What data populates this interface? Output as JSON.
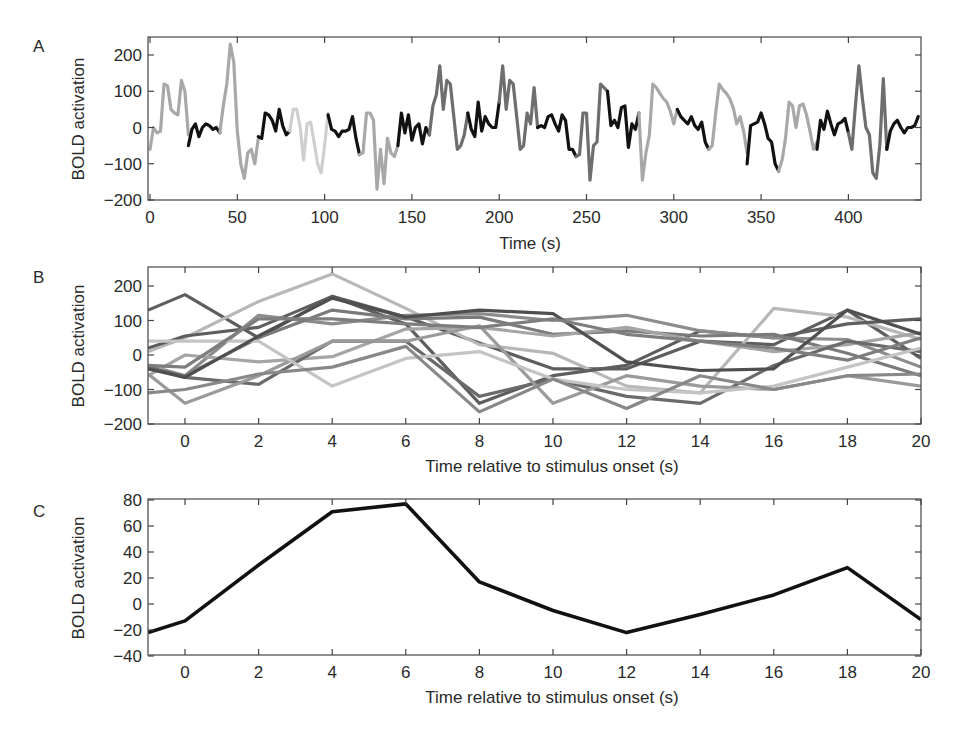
{
  "chart_data": [
    {
      "panel": "A",
      "type": "line",
      "title": "",
      "xlabel": "Time (s)",
      "ylabel": "BOLD activation",
      "xlim": [
        0,
        440
      ],
      "ylim": [
        -200,
        250
      ],
      "xticks": [
        0,
        50,
        100,
        150,
        200,
        250,
        300,
        350,
        400
      ],
      "yticks": [
        -200,
        -100,
        0,
        100,
        200
      ],
      "grid": false,
      "note": "Continuous BOLD time series drawn as segments shaded by trial (black / light gray / mid gray / dark gray)",
      "segments": [
        {
          "color": "#a8a8a8",
          "x": [
            0,
            2,
            4,
            6,
            8,
            10,
            12,
            14,
            16,
            18,
            20,
            22
          ],
          "y": [
            -60,
            0,
            -15,
            -10,
            120,
            115,
            50,
            40,
            35,
            130,
            100,
            -20
          ]
        },
        {
          "color": "#111111",
          "x": [
            22,
            24,
            26,
            28,
            30,
            32,
            34,
            36,
            38,
            40
          ],
          "y": [
            -50,
            -5,
            10,
            -25,
            0,
            10,
            5,
            -5,
            0,
            -15
          ]
        },
        {
          "color": "#a8a8a8",
          "x": [
            40,
            42,
            44,
            46,
            48,
            50,
            52,
            54,
            56,
            58,
            60,
            62
          ],
          "y": [
            -15,
            60,
            120,
            230,
            180,
            -10,
            -100,
            -140,
            -70,
            -60,
            -100,
            -30
          ]
        },
        {
          "color": "#111111",
          "x": [
            62,
            64,
            66,
            68,
            70,
            72,
            74,
            76,
            78,
            80
          ],
          "y": [
            -25,
            -30,
            40,
            35,
            20,
            -10,
            50,
            5,
            -20,
            -10
          ]
        },
        {
          "color": "#cfcfcf",
          "x": [
            80,
            82,
            84,
            86,
            88,
            90,
            92,
            94,
            96,
            98,
            100,
            102
          ],
          "y": [
            -10,
            50,
            50,
            0,
            -90,
            10,
            15,
            -40,
            -100,
            -125,
            -50,
            40
          ]
        },
        {
          "color": "#111111",
          "x": [
            102,
            104,
            106,
            108,
            110,
            112,
            114,
            116,
            118,
            120
          ],
          "y": [
            35,
            -5,
            -10,
            -25,
            -10,
            -10,
            -5,
            30,
            -30,
            -75
          ]
        },
        {
          "color": "#a8a8a8",
          "x": [
            120,
            122,
            124,
            126,
            128,
            130,
            132,
            134,
            136,
            138,
            140,
            142
          ],
          "y": [
            -75,
            -70,
            40,
            40,
            20,
            -170,
            -60,
            -155,
            -30,
            -70,
            -80,
            -50
          ]
        },
        {
          "color": "#111111",
          "x": [
            142,
            144,
            146,
            148,
            150,
            152,
            154,
            156,
            158,
            160
          ],
          "y": [
            -50,
            40,
            -15,
            35,
            -35,
            0,
            10,
            -45,
            0,
            -20
          ]
        },
        {
          "color": "#6e6e6e",
          "x": [
            160,
            162,
            164,
            166,
            168,
            170,
            172,
            174,
            176,
            178,
            180,
            182
          ],
          "y": [
            -20,
            60,
            90,
            170,
            50,
            130,
            120,
            30,
            -60,
            -50,
            -20,
            40
          ]
        },
        {
          "color": "#111111",
          "x": [
            182,
            184,
            186,
            188,
            190,
            192,
            194,
            196,
            198,
            200
          ],
          "y": [
            40,
            -5,
            -25,
            70,
            -10,
            30,
            10,
            0,
            0,
            70
          ]
        },
        {
          "color": "#6e6e6e",
          "x": [
            200,
            202,
            204,
            206,
            208,
            210,
            212,
            214,
            216,
            218,
            220,
            222
          ],
          "y": [
            70,
            170,
            50,
            130,
            120,
            30,
            -60,
            -50,
            40,
            10,
            110,
            0
          ]
        },
        {
          "color": "#111111",
          "x": [
            222,
            224,
            226,
            228,
            230,
            232,
            234,
            236,
            238,
            240,
            242,
            244
          ],
          "y": [
            0,
            5,
            0,
            30,
            35,
            10,
            -10,
            35,
            20,
            -60,
            -60,
            -80
          ]
        },
        {
          "color": "#6e6e6e",
          "x": [
            244,
            246,
            248,
            250,
            252,
            254,
            256,
            258,
            260,
            262
          ],
          "y": [
            -80,
            -75,
            40,
            40,
            -145,
            -50,
            -40,
            120,
            110,
            100
          ]
        },
        {
          "color": "#111111",
          "x": [
            262,
            264,
            266,
            268,
            270,
            272,
            274,
            276,
            278,
            280
          ],
          "y": [
            100,
            5,
            20,
            0,
            55,
            60,
            -55,
            10,
            -5,
            40
          ]
        },
        {
          "color": "#a8a8a8",
          "x": [
            280,
            282,
            284,
            286,
            288,
            290,
            292,
            294,
            296,
            298,
            300,
            302
          ],
          "y": [
            40,
            -145,
            -70,
            -20,
            120,
            110,
            95,
            80,
            70,
            45,
            10,
            50
          ]
        },
        {
          "color": "#111111",
          "x": [
            302,
            304,
            306,
            308,
            310,
            312,
            314,
            316,
            318,
            320
          ],
          "y": [
            50,
            30,
            20,
            10,
            30,
            5,
            -5,
            15,
            -40,
            -60
          ]
        },
        {
          "color": "#a8a8a8",
          "x": [
            320,
            322,
            324,
            326,
            328,
            330,
            332,
            334,
            336,
            338,
            340,
            342
          ],
          "y": [
            -60,
            -50,
            40,
            120,
            105,
            95,
            80,
            55,
            10,
            30,
            -10,
            -70
          ]
        },
        {
          "color": "#111111",
          "x": [
            342,
            344,
            346,
            348,
            350,
            352,
            354,
            356,
            358,
            360
          ],
          "y": [
            -100,
            5,
            10,
            15,
            40,
            10,
            -30,
            -40,
            -100,
            -120
          ]
        },
        {
          "color": "#a8a8a8",
          "x": [
            360,
            362,
            364,
            366,
            368,
            370,
            372,
            374,
            376,
            378,
            380,
            382
          ],
          "y": [
            -120,
            -90,
            -30,
            70,
            60,
            0,
            60,
            65,
            35,
            -10,
            -60,
            -40
          ]
        },
        {
          "color": "#111111",
          "x": [
            382,
            384,
            386,
            388,
            390,
            392,
            394,
            396,
            398,
            400
          ],
          "y": [
            -60,
            20,
            -5,
            45,
            10,
            -20,
            10,
            15,
            25,
            -15
          ]
        },
        {
          "color": "#6e6e6e",
          "x": [
            400,
            402,
            404,
            406,
            408,
            410,
            412,
            414,
            416,
            418,
            420,
            422
          ],
          "y": [
            -15,
            -60,
            60,
            170,
            80,
            0,
            -20,
            -125,
            -140,
            -50,
            135,
            -60
          ]
        },
        {
          "color": "#111111",
          "x": [
            422,
            424,
            426,
            428,
            430,
            432,
            434,
            436,
            438,
            440
          ],
          "y": [
            -60,
            -10,
            10,
            20,
            0,
            -15,
            0,
            0,
            5,
            30
          ]
        }
      ]
    },
    {
      "panel": "B",
      "type": "line",
      "title": "",
      "xlabel": "Time relative to stimulus onset (s)",
      "ylabel": "BOLD activation",
      "xlim": [
        -1,
        20
      ],
      "ylim": [
        -200,
        250
      ],
      "xticks": [
        0,
        2,
        4,
        6,
        8,
        10,
        12,
        14,
        16,
        18,
        20
      ],
      "yticks": [
        -200,
        -100,
        0,
        100,
        200
      ],
      "grid": false,
      "x": [
        -1,
        0,
        2,
        4,
        6,
        8,
        10,
        12,
        14,
        16,
        18,
        20
      ],
      "series": [
        {
          "name": "trial 1",
          "color": "#5e5e5e",
          "values": [
            130,
            175,
            50,
            170,
            110,
            35,
            -40,
            -40,
            40,
            30,
            130,
            -10
          ]
        },
        {
          "name": "trial 2",
          "color": "#b8b8b8",
          "values": [
            10,
            50,
            155,
            235,
            135,
            30,
            5,
            -90,
            -110,
            135,
            110,
            45
          ]
        },
        {
          "name": "trial 3",
          "color": "#5e5e5e",
          "values": [
            20,
            55,
            80,
            170,
            90,
            -140,
            -60,
            -30,
            70,
            50,
            90,
            105
          ]
        },
        {
          "name": "trial 4",
          "color": "#8c8c8c",
          "values": [
            -30,
            -60,
            115,
            90,
            115,
            120,
            100,
            115,
            70,
            50,
            45,
            -35
          ]
        },
        {
          "name": "trial 5",
          "color": "#7a7a7a",
          "values": [
            -40,
            -60,
            50,
            130,
            105,
            110,
            60,
            70,
            55,
            60,
            5,
            -60
          ]
        },
        {
          "name": "trial 6",
          "color": "#a5a5a5",
          "values": [
            -60,
            0,
            -20,
            -5,
            75,
            80,
            55,
            80,
            40,
            10,
            30,
            65
          ]
        },
        {
          "name": "trial 7",
          "color": "#6a6a6a",
          "values": [
            -35,
            -65,
            -85,
            40,
            40,
            -120,
            -70,
            -120,
            -140,
            -30,
            40,
            10
          ]
        },
        {
          "name": "trial 8",
          "color": "#9a9a9a",
          "values": [
            -55,
            -140,
            -60,
            40,
            40,
            85,
            -140,
            -60,
            -90,
            -100,
            -60,
            -90
          ]
        },
        {
          "name": "trial 9",
          "color": "#c4c4c4",
          "values": [
            40,
            40,
            40,
            -90,
            -10,
            10,
            -70,
            -100,
            -110,
            -90,
            -35,
            20
          ]
        },
        {
          "name": "trial 10",
          "color": "#888888",
          "values": [
            -110,
            -100,
            -55,
            -35,
            25,
            -165,
            -70,
            -155,
            -60,
            -100,
            -60,
            -55
          ]
        },
        {
          "name": "trial 11",
          "color": "#4f4f4f",
          "values": [
            -40,
            -65,
            55,
            165,
            110,
            130,
            120,
            -20,
            -45,
            -40,
            130,
            60
          ]
        },
        {
          "name": "trial 12",
          "color": "#7e7e7e",
          "values": [
            -30,
            -35,
            105,
            105,
            90,
            80,
            105,
            60,
            40,
            20,
            -15,
            50
          ]
        }
      ]
    },
    {
      "panel": "C",
      "type": "line",
      "title": "",
      "xlabel": "Time relative to stimulus onset (s)",
      "ylabel": "BOLD activation",
      "xlim": [
        -1,
        20
      ],
      "ylim": [
        -40,
        80
      ],
      "xticks": [
        0,
        2,
        4,
        6,
        8,
        10,
        12,
        14,
        16,
        18,
        20
      ],
      "yticks": [
        -40,
        -20,
        0,
        20,
        40,
        60,
        80
      ],
      "grid": false,
      "x": [
        -1,
        0,
        2,
        4,
        6,
        8,
        10,
        12,
        14,
        16,
        18,
        20
      ],
      "series": [
        {
          "name": "average",
          "color": "#111111",
          "values": [
            -22,
            -13,
            30,
            71,
            77,
            17,
            -5,
            -22,
            -8,
            7,
            28,
            -12
          ]
        }
      ]
    }
  ],
  "labels": {
    "panel_a": "A",
    "panel_b": "B",
    "panel_c": "C",
    "ylabel": "BOLD activation",
    "xlabel_a": "Time (s)",
    "xlabel_bc": "Time relative to stimulus onset (s)"
  }
}
